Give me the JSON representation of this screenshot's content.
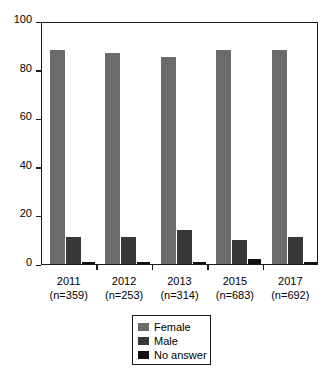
{
  "chart_data": {
    "type": "bar",
    "title": "",
    "subtitle": "",
    "xlabel": "",
    "ylabel": "",
    "ylim": [
      0,
      100
    ],
    "yticks": [
      0,
      20,
      40,
      60,
      80,
      100
    ],
    "grid": false,
    "legend_position": "bottom-center",
    "categories": [
      "2011",
      "2012",
      "2013",
      "2015",
      "2017"
    ],
    "category_sublabels": [
      "(n=359)",
      "(n=253)",
      "(n=314)",
      "(n=683)",
      "(n=692)"
    ],
    "sample_sizes": [
      359,
      253,
      314,
      683,
      692
    ],
    "series": [
      {
        "name": "Female",
        "color": "#6b6b6b",
        "values": [
          88,
          87,
          85,
          88,
          88
        ]
      },
      {
        "name": "Male",
        "color": "#373737",
        "values": [
          11,
          11,
          14,
          10,
          11
        ]
      },
      {
        "name": "No answer",
        "color": "#111111",
        "values": [
          1,
          1,
          1,
          2,
          1
        ]
      }
    ]
  },
  "axis": {
    "y_tick_labels": [
      "100",
      "80",
      "60",
      "40",
      "20",
      "0"
    ]
  },
  "legend": {
    "items": [
      {
        "label": "Female"
      },
      {
        "label": "Male"
      },
      {
        "label": "No answer"
      }
    ]
  }
}
